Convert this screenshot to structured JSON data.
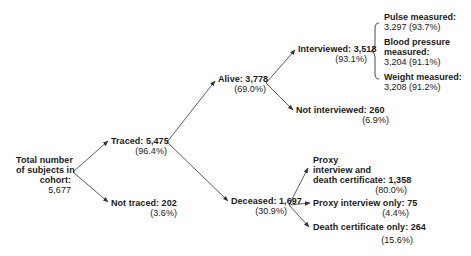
{
  "diagram": {
    "nodes": {
      "total": {
        "lines": [
          "Total number",
          "of subjects in",
          "cohort:",
          "5,677"
        ]
      },
      "traced": {
        "label": "Traced: 5,475",
        "pct": "(96.4%)"
      },
      "not_traced": {
        "label": "Not traced: 202",
        "pct": "(3.6%)"
      },
      "alive": {
        "label": "Alive: 3,778",
        "pct": "(69.0%)"
      },
      "deceased": {
        "label": "Deceased: 1,697",
        "pct": "(30.9%)"
      },
      "interviewed": {
        "label": "Interviewed: 3,518",
        "pct": "(93.1%)"
      },
      "not_interviewed": {
        "label": "Not interviewed: 260",
        "pct": "(6.9%)"
      },
      "proxy_and_death": {
        "lines": [
          "Proxy",
          "interview and",
          "death certificate: 1,358"
        ],
        "pct": "(80.0%)"
      },
      "proxy_only": {
        "label": "Proxy interview only: 75",
        "pct": "(4.4%)"
      },
      "death_only": {
        "label": "Death certificate only: 264",
        "pct": "(15.6%)"
      }
    },
    "measurements": [
      {
        "label_lines": [
          "Pulse measured:"
        ],
        "value": "3,297 (93.7%)"
      },
      {
        "label_lines": [
          "Blood pressure",
          "measured:"
        ],
        "value": "3,204 (91.1%)"
      },
      {
        "label_lines": [
          "Weight measured:"
        ],
        "value": "3,208 (91.2%)"
      }
    ],
    "colors": {
      "line": "#333333",
      "text": "#1a1a1a",
      "background": "#ffffff"
    }
  }
}
